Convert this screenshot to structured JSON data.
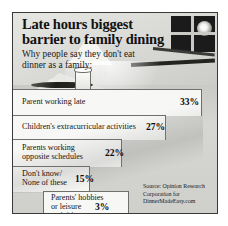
{
  "graphic": {
    "title": "Late hours biggest barrier to family dining",
    "subtitle": "Why people say they don't eat dinner as a family:",
    "source": "Source: Opinion Research Corporation for DinnerMadeEasy.com",
    "border_color": "#3a3a38",
    "panel_color": "#d9d9d6",
    "step_color": "#f7f7f5",
    "text_color": "#151514"
  },
  "illustration": {
    "window_label": "night-window-with-moon",
    "lamp_label": "table-lamp",
    "glass_label": "drinking-glass",
    "knife_label": "table-knife",
    "cloth_label": "tablecloth"
  },
  "chart_data": {
    "type": "bar",
    "title": "Late hours biggest barrier to family dining",
    "subtitle": "Why people say they don't eat dinner as a family:",
    "xlabel": "",
    "ylabel": "",
    "xlim": [
      0,
      35
    ],
    "grid": false,
    "legend": "none",
    "orientation": "horizontal",
    "unit": "%",
    "categories": [
      "Parent working late",
      "Children's extracurricular activities",
      "Parents working opposite schedules",
      "Don't know/ None of these",
      "Parents' hobbies or leisure activities"
    ],
    "values": [
      33,
      27,
      22,
      15,
      3
    ],
    "value_labels": [
      "33%",
      "27%",
      "22%",
      "15%",
      "3%"
    ],
    "source": "Source: Opinion Research Corporation for DinnerMadeEasy.com"
  },
  "rows": [
    {
      "label": "Parent working late",
      "pct": "33%"
    },
    {
      "label": "Children's extracurricular activities",
      "pct": "27%"
    },
    {
      "label": "Parents working\nopposite schedules",
      "pct": "22%"
    },
    {
      "label": "Don't know/\nNone of these",
      "pct": "15%"
    },
    {
      "label": "Parents' hobbies\nor leisure\nactivities",
      "pct": "3%"
    }
  ]
}
